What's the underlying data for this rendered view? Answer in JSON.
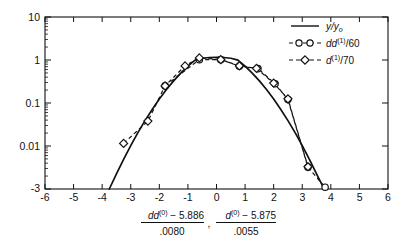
{
  "figure": {
    "kind": "semilog-plot",
    "background": "#ffffff",
    "ink": "#111111"
  },
  "chart_data": {
    "type": "line",
    "title": "",
    "subtitle": "",
    "xlabel": "(dd^(0) - 5.886)/.0080 , (d^(0) - 5.875)/.0055",
    "ylabel": "",
    "yscale": "log",
    "xlim": [
      -6,
      6
    ],
    "ylim": [
      0.001,
      10
    ],
    "grid": false,
    "legend_position": "top-right",
    "xticks": [
      -6,
      -5,
      -4,
      -3,
      -2,
      -1,
      0,
      1,
      2,
      3,
      4,
      5,
      6
    ],
    "xticklabels": [
      "-6",
      "-5",
      "-4",
      "-3",
      "-2",
      "-1",
      "0",
      "1",
      "2",
      "3",
      "4",
      "5",
      "6"
    ],
    "yticks": [
      10,
      1,
      0.1,
      0.01,
      0.001
    ],
    "yticklabels": [
      "10",
      "1",
      "0.1",
      "0.01",
      "-3"
    ],
    "series": [
      {
        "name": "y/y_o",
        "legend_text": "y/yo",
        "style": "solid",
        "marker": "none",
        "x": [
          -3.75,
          -3.5,
          -3.25,
          -3.0,
          -2.75,
          -2.5,
          -2.25,
          -2.0,
          -1.75,
          -1.5,
          -1.25,
          -1.0,
          -0.75,
          -0.5,
          -0.25,
          0.0,
          0.25,
          0.5,
          0.75,
          1.0,
          1.25,
          1.5,
          1.75,
          2.0,
          2.25,
          2.5,
          2.75,
          3.0,
          3.25,
          3.5,
          3.75,
          3.85
        ],
        "y": [
          0.001,
          0.00225,
          0.0049,
          0.0102,
          0.0204,
          0.0389,
          0.0709,
          0.1235,
          0.2055,
          0.3266,
          0.4959,
          0.7192,
          0.9963,
          1.0977,
          1.144,
          1.15,
          1.144,
          1.0977,
          0.9963,
          0.7192,
          0.4959,
          0.3266,
          0.2055,
          0.1235,
          0.0709,
          0.0389,
          0.0204,
          0.0102,
          0.0049,
          0.00225,
          0.00105,
          0.001
        ]
      },
      {
        "name": "dd^(1)/60",
        "legend_text": "dd(1)/60",
        "style": "dashed",
        "marker": "circle",
        "x": [
          -1.8,
          -0.6,
          0.15,
          0.8,
          1.45,
          2.05,
          2.5,
          3.2,
          3.8
        ],
        "y": [
          0.25,
          1.02,
          1.02,
          0.72,
          0.63,
          0.28,
          0.12,
          0.0032,
          0.0011
        ]
      },
      {
        "name": "d^(1)/70",
        "legend_text": "d(1)/70",
        "style": "dashed",
        "marker": "diamond",
        "x": [
          -3.25,
          -2.4,
          -1.8,
          -1.1,
          -0.6,
          0.15,
          0.8,
          1.4,
          2.0,
          2.5,
          3.2
        ],
        "y": [
          0.0115,
          0.038,
          0.25,
          0.73,
          1.12,
          1.02,
          0.73,
          0.64,
          0.29,
          0.125,
          0.0033
        ]
      }
    ]
  },
  "legend": {
    "items": [
      {
        "label_num": "y",
        "label_den": "yo",
        "kind": "fraction-italic",
        "style": "solid",
        "marker": "none"
      },
      {
        "label_base": "dd",
        "label_sup": "(1)",
        "label_tail": "/60",
        "style": "dashed",
        "marker": "circle"
      },
      {
        "label_base": "d",
        "label_sup": "(1)",
        "label_tail": "/70",
        "style": "dashed",
        "marker": "diamond"
      }
    ]
  },
  "xcaption": {
    "left_numerator_base": "dd",
    "left_numerator_sup": "(0)",
    "left_numerator_rest": " − 5.886",
    "left_denominator": ".0080",
    "separator": ",",
    "right_numerator_base": "d",
    "right_numerator_sup": "(0)",
    "right_numerator_rest": " − 5.875",
    "right_denominator": ".0055"
  },
  "ylabels": {
    "t0": "10",
    "t1": "1",
    "t2": "0.1",
    "t3": "0.01",
    "t4": "-3"
  },
  "xlabels": {
    "m6": "-6",
    "m5": "-5",
    "m4": "-4",
    "m3": "-3",
    "m2": "-2",
    "m1": "-1",
    "z": "0",
    "p1": "1",
    "p2": "2",
    "p3": "3",
    "p4": "4",
    "p5": "5",
    "p6": "6"
  }
}
